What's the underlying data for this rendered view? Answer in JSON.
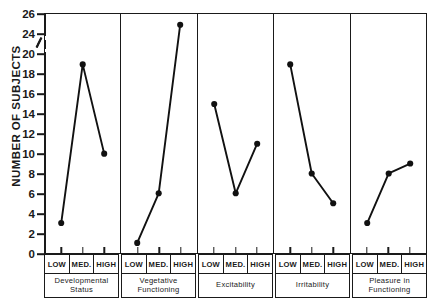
{
  "chart_data": {
    "type": "line",
    "title": "",
    "xlabel": "",
    "ylabel": "NUMBER OF SUBJECTS",
    "categories": [
      "LOW",
      "MED.",
      "HIGH"
    ],
    "yticks": [
      0,
      2,
      4,
      6,
      8,
      10,
      12,
      14,
      16,
      18,
      20,
      24,
      26
    ],
    "ylim": [
      0,
      26
    ],
    "axis_break": {
      "between": [
        20,
        24
      ],
      "present": true
    },
    "grid": false,
    "legend": null,
    "panels": [
      {
        "name": "Developmental Status",
        "categories": [
          "LOW",
          "MED.",
          "HIGH"
        ],
        "values": [
          3,
          19,
          10
        ]
      },
      {
        "name": "Vegetative Functioning",
        "categories": [
          "LOW",
          "MED.",
          "HIGH"
        ],
        "values": [
          1,
          6,
          25
        ]
      },
      {
        "name": "Excitability",
        "categories": [
          "LOW",
          "MED.",
          "HIGH"
        ],
        "values": [
          15,
          6,
          11
        ]
      },
      {
        "name": "Irritability",
        "categories": [
          "LOW",
          "MED.",
          "HIGH"
        ],
        "values": [
          19,
          8,
          5
        ]
      },
      {
        "name": "Pleasure in Functioning",
        "categories": [
          "LOW",
          "MED.",
          "HIGH"
        ],
        "values": [
          3,
          8,
          9
        ]
      }
    ],
    "series_color": "#111111",
    "marker": "filled-circle"
  },
  "axis": {
    "y_title": "NUMBER OF SUBJECTS",
    "tick_labels": [
      "26",
      "24",
      "20",
      "18",
      "16",
      "14",
      "12",
      "10",
      "8",
      "6",
      "4",
      "2",
      "0"
    ]
  }
}
